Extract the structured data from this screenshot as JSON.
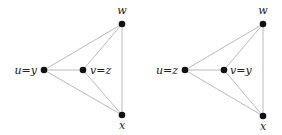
{
  "graphs": [
    {
      "nodes": {
        "w": {
          "label": "w",
          "x": 122,
          "y": 24
        },
        "u": {
          "label": "u=y",
          "x": 44,
          "y": 70
        },
        "v": {
          "label": "v=z",
          "x": 83,
          "y": 70
        },
        "x": {
          "label": "x",
          "x": 122,
          "y": 115
        }
      },
      "edges": [
        [
          "u",
          "w"
        ],
        [
          "u",
          "v"
        ],
        [
          "u",
          "x"
        ],
        [
          "v",
          "w"
        ],
        [
          "v",
          "x"
        ],
        [
          "w",
          "x"
        ]
      ]
    },
    {
      "nodes": {
        "w": {
          "label": "w",
          "x": 263,
          "y": 24
        },
        "u": {
          "label": "u=z",
          "x": 185,
          "y": 70
        },
        "v": {
          "label": "v=y",
          "x": 224,
          "y": 70
        },
        "x": {
          "label": "x",
          "x": 263,
          "y": 116
        }
      },
      "edges": [
        [
          "u",
          "w"
        ],
        [
          "u",
          "v"
        ],
        [
          "u",
          "x"
        ],
        [
          "v",
          "w"
        ],
        [
          "v",
          "x"
        ],
        [
          "w",
          "x"
        ]
      ]
    }
  ],
  "colors": {
    "edge": "#a8a8a8",
    "node": "#111111",
    "label": "#222222"
  }
}
